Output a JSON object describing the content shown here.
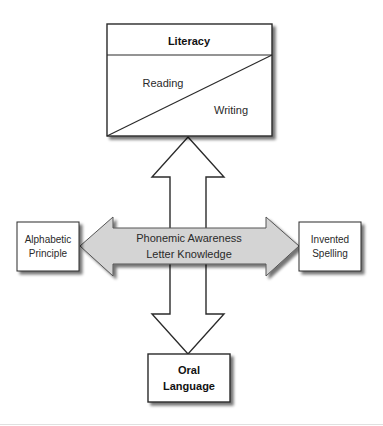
{
  "diagram": {
    "literacy_box": {
      "title": "Literacy",
      "upper_label": "Reading",
      "lower_label": "Writing"
    },
    "oral_language_box": {
      "line1": "Oral",
      "line2": "Language"
    },
    "alphabetic_principle_box": {
      "line1": "Alphabetic",
      "line2": "Principle"
    },
    "invented_spelling_box": {
      "line1": "Invented",
      "line2": "Spelling"
    },
    "horizontal_arrow": {
      "line1": "Phonemic Awareness",
      "line2": "Letter Knowledge"
    },
    "vertical_arrow": {
      "direction": "bidirectional",
      "connects": [
        "Literacy",
        "Oral Language"
      ]
    },
    "colors": {
      "stroke": "#2b2b2b",
      "horizontal_arrow_fill": "#d4d4d4",
      "box_fill": "#ffffff",
      "shadow": "#9a9a9a",
      "footer_line": "#e0e0e0"
    }
  }
}
